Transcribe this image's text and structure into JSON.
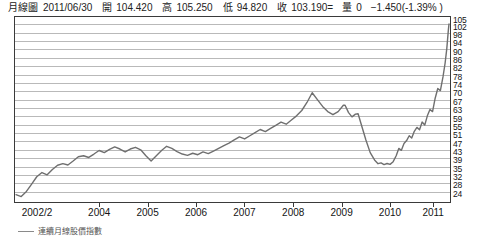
{
  "quote": {
    "chart_type_label": "月線圖",
    "date": "2011/06/30",
    "open_label": "開",
    "open": "104.420",
    "high_label": "高",
    "high": "105.250",
    "low_label": "低",
    "low": "94.820",
    "close_label": "收",
    "close": "103.190=",
    "volume_label": "量",
    "volume": "0",
    "change": "−1.450(-1.39% )"
  },
  "legend": {
    "series_label": "連續月線股價指數"
  },
  "colors": {
    "line": "#6f6f6f",
    "grid": "#b9b9b9",
    "frame": "#3a3a3a",
    "text": "#141414"
  },
  "chart_data": {
    "type": "line",
    "title": "月線圖 2011/06/30",
    "xlabel": "",
    "ylabel": "",
    "grid": true,
    "legend_position": "below-left",
    "ylim": [
      24,
      105
    ],
    "y_ticks": [
      105,
      102,
      98,
      94,
      90,
      86,
      82,
      78,
      74,
      70,
      67,
      63,
      59,
      55,
      51,
      47,
      43,
      39,
      35,
      32,
      28,
      24
    ],
    "x_ticks": [
      "2002/2",
      "2004",
      "2005",
      "2006",
      "2007",
      "2008",
      "2009",
      "2010",
      "2011"
    ],
    "x_tick_positions": [
      0.0,
      0.195,
      0.307,
      0.419,
      0.531,
      0.644,
      0.756,
      0.868,
      0.968
    ],
    "series": [
      {
        "name": "連續月線股價指數",
        "x": [
          0.0,
          0.013,
          0.026,
          0.039,
          0.052,
          0.065,
          0.078,
          0.09,
          0.103,
          0.116,
          0.129,
          0.142,
          0.155,
          0.168,
          0.181,
          0.195,
          0.208,
          0.221,
          0.234,
          0.247,
          0.26,
          0.273,
          0.286,
          0.299,
          0.307,
          0.32,
          0.333,
          0.346,
          0.359,
          0.372,
          0.385,
          0.398,
          0.411,
          0.419,
          0.432,
          0.445,
          0.458,
          0.471,
          0.484,
          0.497,
          0.51,
          0.523,
          0.531,
          0.544,
          0.557,
          0.57,
          0.583,
          0.596,
          0.609,
          0.622,
          0.635,
          0.644,
          0.657,
          0.67,
          0.683,
          0.696,
          0.709,
          0.722,
          0.735,
          0.748,
          0.756,
          0.769,
          0.782,
          0.795,
          0.808,
          0.821,
          0.834,
          0.847,
          0.86,
          0.868,
          0.881,
          0.894,
          0.907,
          0.92,
          0.933,
          0.946,
          0.959,
          0.968,
          0.981,
          0.994,
          1.0
        ],
        "values": [
          25.5,
          24.8,
          27.5,
          31.0,
          34.5,
          35.5,
          37.5,
          38.0,
          40.0,
          39.5,
          40.5,
          42.0,
          43.0,
          44.5,
          45.5,
          46.5,
          45.5,
          47.0,
          48.5,
          47.5,
          46.0,
          47.5,
          48.5,
          44.0,
          40.5,
          43.5,
          46.0,
          49.0,
          51.5,
          50.0,
          48.5,
          47.5,
          46.5,
          46.0,
          45.0,
          46.5,
          45.5,
          47.0,
          46.0,
          47.5,
          49.0,
          50.5,
          51.5,
          53.0,
          54.5,
          56.0,
          57.5,
          56.5,
          58.0,
          60.0,
          59.0,
          60.5,
          62.0,
          61.0,
          62.5,
          64.0,
          63.0,
          62.0,
          63.5,
          66.5,
          72.0,
          69.0,
          67.5,
          65.5,
          63.5,
          62.0,
          66.5,
          63.0,
          63.5,
          63.5,
          55.0,
          48.0,
          43.5,
          40.0,
          39.0,
          38.5,
          38.5,
          40.0,
          42.5,
          45.0,
          46.5
        ],
        "color": "#6f6f6f"
      }
    ],
    "series_tail": {
      "note": "continuation after 2010 to 2011 close",
      "x": [
        0.881,
        0.894,
        0.907,
        0.92,
        0.933,
        0.946,
        0.959,
        0.968,
        0.981,
        0.994,
        1.0
      ],
      "values": [
        55.0,
        54.0,
        57.0,
        59.0,
        58.0,
        62.5,
        61.0,
        60.0,
        63.0,
        66.0,
        64.5
      ]
    }
  }
}
